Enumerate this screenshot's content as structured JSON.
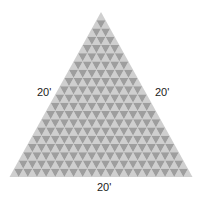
{
  "diagram": {
    "shape": "equilateral-triangle-grid",
    "rows": 20,
    "apex": [
      101,
      12
    ],
    "bottom_left": [
      10,
      177
    ],
    "bottom_right": [
      193,
      177
    ],
    "colors": {
      "up_triangle": "#cfcfcf",
      "down_triangle": "#9e9e9e",
      "background": "#ffffff",
      "label_text": "#1a1a1a"
    },
    "labels": {
      "left_side": "20'",
      "right_side": "20'",
      "bottom_side": "20'"
    }
  }
}
